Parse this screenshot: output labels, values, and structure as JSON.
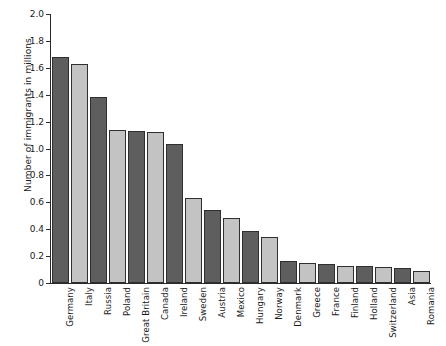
{
  "chart_data": {
    "type": "bar",
    "title": "",
    "subtitle": "",
    "xlabel": "",
    "ylabel": "Number of immigrants in millions",
    "ylim": [
      0,
      2.0
    ],
    "ytick_labels": [
      "2.0",
      "1.8",
      "1.6",
      "1.4",
      "1.2",
      "1.0",
      "0.8",
      "0.6",
      "0.4",
      "0.2",
      "0"
    ],
    "ytick_values": [
      2.0,
      1.8,
      1.6,
      1.4,
      1.2,
      1.0,
      0.8,
      0.6,
      0.4,
      0.2,
      0
    ],
    "grid": false,
    "legend": false,
    "legend_position": "none",
    "categories": [
      "Germany",
      "Italy",
      "Russia",
      "Poland",
      "Great Britain",
      "Canada",
      "Ireland",
      "Sweden",
      "Austria",
      "Mexico",
      "Hungary",
      "Norway",
      "Denmark",
      "Greece",
      "France",
      "Finland",
      "Holland",
      "Switzerland",
      "Asia",
      "Romania"
    ],
    "values": [
      1.68,
      1.63,
      1.38,
      1.14,
      1.13,
      1.12,
      1.03,
      0.63,
      0.54,
      0.48,
      0.39,
      0.34,
      0.16,
      0.15,
      0.14,
      0.13,
      0.13,
      0.12,
      0.11,
      0.09
    ],
    "bar_colors": [
      "#5e5e5e",
      "#c3c3c3",
      "#5e5e5e",
      "#c3c3c3",
      "#5e5e5e",
      "#c3c3c3",
      "#5e5e5e",
      "#c3c3c3",
      "#5e5e5e",
      "#c3c3c3",
      "#5e5e5e",
      "#c3c3c3",
      "#5e5e5e",
      "#c3c3c3",
      "#5e5e5e",
      "#c3c3c3",
      "#5e5e5e",
      "#c3c3c3",
      "#5e5e5e",
      "#c3c3c3"
    ],
    "colors": {
      "dark_bar": "#5e5e5e",
      "light_bar": "#c3c3c3",
      "bar_outline": "#2f2f2f",
      "axis": "#2b2b2b",
      "text": "#1b1b1b",
      "background": "#ffffff"
    }
  }
}
